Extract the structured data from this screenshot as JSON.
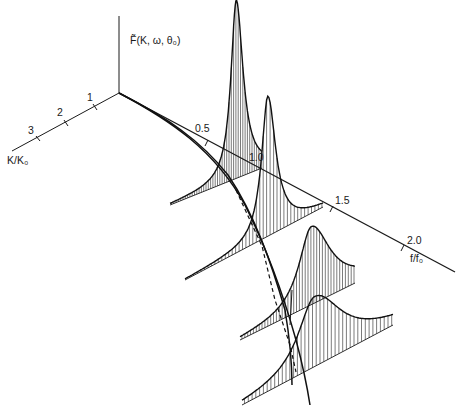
{
  "figure": {
    "vertical_axis_label": "F̃(K, ω, θ₀)",
    "frequency_axis_label": "f/f₀",
    "wavenumber_axis_label": "K/K₀",
    "frequency_ticks": [
      "0.5",
      "1.0",
      "1.5",
      "2.0"
    ],
    "wavenumber_ticks": [
      "1",
      "2",
      "3"
    ]
  },
  "spectra": [
    {
      "name": "spectrum-1",
      "peak_f_over_f0": 0.9,
      "relative_height": 1.0,
      "width": "narrow"
    },
    {
      "name": "spectrum-2",
      "peak_f_over_f0": 1.05,
      "relative_height": 0.72,
      "width": "narrow"
    },
    {
      "name": "spectrum-3",
      "peak_f_over_f0": 1.3,
      "relative_height": 0.42,
      "width": "broad"
    },
    {
      "name": "spectrum-4",
      "peak_f_over_f0": 1.4,
      "relative_height": 0.32,
      "width": "broad"
    }
  ],
  "colors": {
    "ink": "#1a1a1a",
    "paper": "#ffffff"
  }
}
